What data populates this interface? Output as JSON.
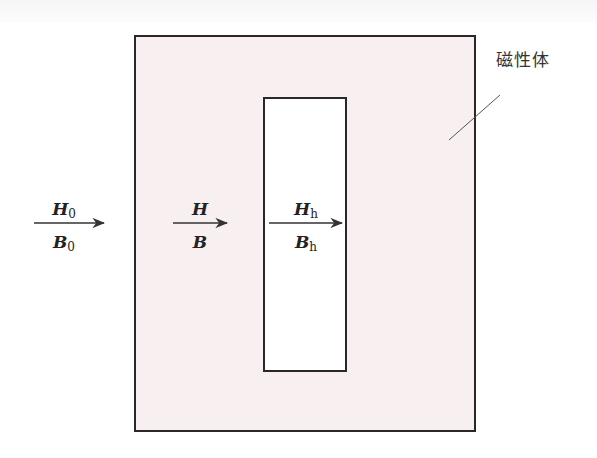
{
  "diagram": {
    "title_label": "磁性体",
    "colors": {
      "magnetic_body_fill": "#f8f0f0",
      "hole_fill": "#ffffff",
      "stroke": "#2b2627"
    },
    "regions": [
      {
        "id": "outside",
        "H": "H",
        "H_sub": "0",
        "B": "B",
        "B_sub": "0"
      },
      {
        "id": "magnetic_body",
        "H": "H",
        "H_sub": "",
        "B": "B",
        "B_sub": ""
      },
      {
        "id": "hole",
        "H": "H",
        "H_sub": "h",
        "B": "B",
        "B_sub": "h"
      }
    ]
  }
}
